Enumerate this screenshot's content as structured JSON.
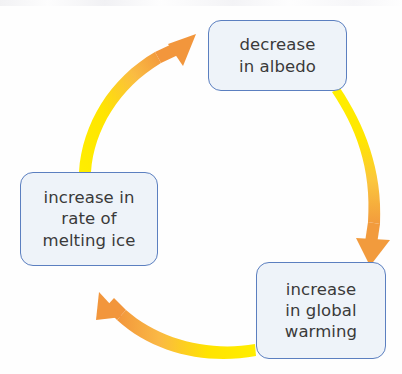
{
  "diagram": {
    "type": "cycle",
    "direction": "clockwise",
    "background_color": "#ffffff",
    "node_style": {
      "fill": "#eef3f9",
      "border": "#5b7fc0",
      "text_color": "#3a3a3a"
    },
    "arrow_style": {
      "start_color": "#ffee00",
      "end_color": "#f29b3d"
    },
    "nodes": [
      {
        "id": "decrease-albedo",
        "label": "decrease\nin albedo",
        "position": "top"
      },
      {
        "id": "global-warming",
        "label": "increase\nin global\nwarming",
        "position": "bottom-right"
      },
      {
        "id": "melting-ice",
        "label": "increase in\nrate of\nmelting ice",
        "position": "left"
      }
    ],
    "arrows": [
      {
        "id": "albedo-to-warming",
        "from": "decrease-albedo",
        "to": "global-warming",
        "side": "right"
      },
      {
        "id": "warming-to-melting",
        "from": "global-warming",
        "to": "melting-ice",
        "side": "bottom"
      },
      {
        "id": "melting-to-albedo",
        "from": "melting-ice",
        "to": "decrease-albedo",
        "side": "top-left"
      }
    ]
  }
}
